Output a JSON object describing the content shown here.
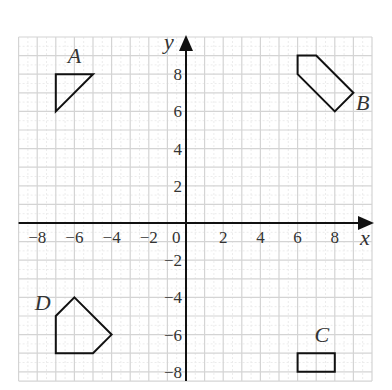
{
  "axes": {
    "x_label": "x",
    "y_label": "y",
    "origin_label": "0",
    "x_ticks": [
      -8,
      -6,
      -4,
      -2,
      2,
      4,
      6,
      8
    ],
    "y_ticks": [
      -8,
      -6,
      -4,
      -2,
      2,
      4,
      6,
      8
    ],
    "x_range": [
      -9,
      10
    ],
    "y_range": [
      -8.5,
      10
    ],
    "origin_px": [
      186,
      223
    ],
    "unit_px": 18.6
  },
  "colors": {
    "grid_major": "#d4d4d4",
    "grid_minor": "#ececec",
    "axis": "#111111",
    "shape_stroke": "#111111",
    "label": "#333333"
  },
  "shapes": [
    {
      "name": "A",
      "points": [
        [
          -7,
          8
        ],
        [
          -5,
          8
        ],
        [
          -7,
          6
        ]
      ],
      "label_pos": [
        -6,
        8.6
      ]
    },
    {
      "name": "B",
      "points": [
        [
          6,
          9
        ],
        [
          7,
          9
        ],
        [
          9,
          7
        ],
        [
          8,
          6
        ],
        [
          6,
          8
        ]
      ],
      "label_pos": [
        9.5,
        6.1
      ]
    },
    {
      "name": "C",
      "points": [
        [
          6,
          -7
        ],
        [
          8,
          -7
        ],
        [
          8,
          -8
        ],
        [
          6,
          -8
        ]
      ],
      "label_pos": [
        7.3,
        -6.4
      ]
    },
    {
      "name": "D",
      "points": [
        [
          -6,
          -4
        ],
        [
          -4,
          -6
        ],
        [
          -5,
          -7
        ],
        [
          -7,
          -7
        ],
        [
          -7,
          -5
        ]
      ],
      "label_pos": [
        -7.7,
        -4.7
      ]
    }
  ]
}
